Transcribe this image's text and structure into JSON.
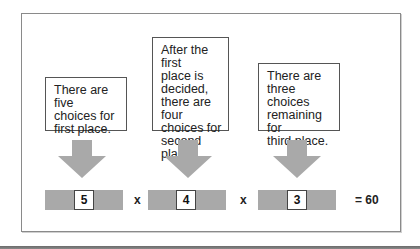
{
  "diagram": {
    "colors": {
      "arrow": "#a9a9a9",
      "bar": "#a9a9a9",
      "frame_border": "#8a8a8a",
      "box_border": "#555555",
      "text": "#222222"
    },
    "steps": [
      {
        "label": "There are five choices for first place.",
        "lines": [
          "There are five",
          "choices for",
          "first place."
        ],
        "value": "5"
      },
      {
        "label": "After the first place is decided, there are four choices for second place.",
        "lines": [
          "After the first",
          "place is",
          "decided,",
          "there are four",
          "choices for",
          "second place."
        ],
        "value": "4"
      },
      {
        "label": "There are three choices remaining for third place.",
        "lines": [
          "There are three",
          "choices",
          "remaining for",
          "third place."
        ],
        "value": "3"
      }
    ],
    "operators": [
      "x",
      "x"
    ],
    "result": "= 60"
  }
}
